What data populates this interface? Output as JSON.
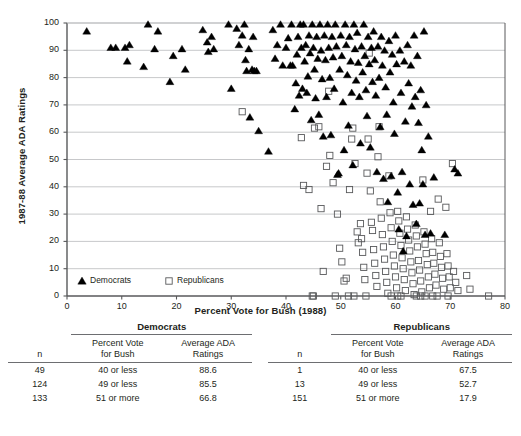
{
  "chart_data": {
    "type": "scatter",
    "title": "",
    "xlabel": "Percent Vote for Bush (1988)",
    "ylabel": "1987-88 Average ADA Ratings",
    "xlim": [
      0,
      80
    ],
    "ylim": [
      0,
      100
    ],
    "xticks": [
      0,
      10,
      20,
      30,
      40,
      50,
      60,
      70,
      80
    ],
    "yticks": [
      0,
      10,
      20,
      30,
      40,
      50,
      60,
      70,
      80,
      90,
      100
    ],
    "grid": "horizontal",
    "legend_position": "inside-bottom-left",
    "series": [
      {
        "name": "Democrats",
        "marker": "filled-triangle",
        "color": "#000000",
        "points": [
          [
            3.6,
            97.0
          ],
          [
            8.0,
            91.0
          ],
          [
            8.9,
            91.0
          ],
          [
            10.6,
            91.0
          ],
          [
            11.0,
            86.0
          ],
          [
            11.4,
            92.0
          ],
          [
            14.0,
            84.0
          ],
          [
            14.8,
            99.5
          ],
          [
            16.0,
            90.5
          ],
          [
            16.6,
            97.0
          ],
          [
            18.8,
            78.5
          ],
          [
            19.4,
            88.0
          ],
          [
            21.0,
            90.5
          ],
          [
            21.6,
            83.0
          ],
          [
            24.8,
            97.5
          ],
          [
            25.6,
            93.0
          ],
          [
            25.8,
            89.5
          ],
          [
            26.4,
            95.0
          ],
          [
            26.8,
            90.5
          ],
          [
            29.5,
            99.5
          ],
          [
            30.0,
            76.0
          ],
          [
            31.0,
            98.0
          ],
          [
            31.4,
            92.0
          ],
          [
            32.0,
            95.5
          ],
          [
            32.4,
            99.5
          ],
          [
            32.6,
            86.5
          ],
          [
            32.8,
            82.5
          ],
          [
            33.2,
            90.5
          ],
          [
            33.4,
            65.5
          ],
          [
            33.8,
            83.0
          ],
          [
            34.0,
            95.0
          ],
          [
            34.2,
            82.5
          ],
          [
            34.6,
            82.5
          ],
          [
            35.0,
            60.5
          ],
          [
            36.8,
            53.0
          ],
          [
            37.6,
            97.5
          ],
          [
            38.0,
            87.0
          ],
          [
            38.4,
            92.0
          ],
          [
            39.0,
            99.5
          ],
          [
            39.4,
            84.5
          ],
          [
            40.0,
            91.0
          ],
          [
            40.4,
            94.5
          ],
          [
            40.8,
            84.5
          ],
          [
            41.0,
            99.5
          ],
          [
            41.2,
            84.5
          ],
          [
            41.6,
            68.5
          ],
          [
            41.8,
            78.0
          ],
          [
            42.0,
            88.5
          ],
          [
            42.2,
            95.0
          ],
          [
            42.4,
            73.5
          ],
          [
            42.6,
            99.5
          ],
          [
            42.8,
            91.0
          ],
          [
            43.0,
            76.0
          ],
          [
            43.2,
            99.5
          ],
          [
            43.4,
            86.0
          ],
          [
            43.6,
            92.0
          ],
          [
            43.8,
            74.5
          ],
          [
            44.0,
            80.5
          ],
          [
            44.2,
            95.5
          ],
          [
            44.4,
            89.0
          ],
          [
            44.6,
            64.5
          ],
          [
            44.8,
            99.5
          ],
          [
            45.0,
            91.0
          ],
          [
            45.2,
            83.0
          ],
          [
            45.4,
            72.5
          ],
          [
            45.6,
            95.0
          ],
          [
            45.8,
            87.0
          ],
          [
            46.0,
            66.5
          ],
          [
            46.2,
            99.5
          ],
          [
            46.4,
            90.0
          ],
          [
            46.6,
            79.5
          ],
          [
            46.8,
            58.5
          ],
          [
            47.0,
            95.5
          ],
          [
            47.2,
            86.5
          ],
          [
            47.4,
            73.0
          ],
          [
            47.6,
            99.5
          ],
          [
            47.8,
            91.0
          ],
          [
            48.0,
            80.0
          ],
          [
            48.2,
            59.0
          ],
          [
            48.4,
            95.0
          ],
          [
            48.6,
            87.5
          ],
          [
            48.8,
            76.0
          ],
          [
            49.0,
            99.5
          ],
          [
            49.2,
            91.5
          ],
          [
            49.4,
            44.5
          ],
          [
            49.6,
            45.0
          ],
          [
            49.8,
            83.0
          ],
          [
            50.0,
            95.5
          ],
          [
            50.2,
            88.0
          ],
          [
            50.4,
            71.0
          ],
          [
            50.6,
            53.5
          ],
          [
            50.8,
            99.5
          ],
          [
            51.0,
            92.0
          ],
          [
            51.2,
            81.0
          ],
          [
            51.4,
            62.5
          ],
          [
            51.6,
            95.0
          ],
          [
            51.8,
            86.0
          ],
          [
            52.0,
            74.5
          ],
          [
            52.2,
            48.0
          ],
          [
            52.4,
            99.5
          ],
          [
            52.6,
            90.5
          ],
          [
            52.8,
            79.0
          ],
          [
            53.0,
            96.5
          ],
          [
            53.2,
            85.5
          ],
          [
            53.4,
            73.0
          ],
          [
            53.6,
            56.0
          ],
          [
            53.8,
            91.5
          ],
          [
            54.0,
            82.0
          ],
          [
            54.2,
            99.5
          ],
          [
            54.4,
            88.0
          ],
          [
            54.6,
            75.5
          ],
          [
            54.8,
            66.0
          ],
          [
            55.0,
            95.0
          ],
          [
            55.2,
            85.0
          ],
          [
            55.4,
            54.5
          ],
          [
            55.6,
            91.0
          ],
          [
            55.8,
            78.5
          ],
          [
            56.0,
            97.0
          ],
          [
            56.2,
            86.5
          ],
          [
            56.4,
            73.5
          ],
          [
            56.6,
            45.5
          ],
          [
            56.8,
            91.5
          ],
          [
            57.0,
            80.0
          ],
          [
            57.2,
            62.0
          ],
          [
            57.4,
            95.0
          ],
          [
            57.6,
            84.5
          ],
          [
            57.8,
            43.0
          ],
          [
            58.0,
            90.0
          ],
          [
            58.2,
            76.5
          ],
          [
            58.4,
            66.5
          ],
          [
            58.6,
            34.5
          ],
          [
            58.8,
            93.5
          ],
          [
            59.0,
            82.0
          ],
          [
            59.2,
            44.0
          ],
          [
            59.4,
            88.5
          ],
          [
            59.6,
            71.0
          ],
          [
            59.8,
            59.5
          ],
          [
            60.0,
            95.5
          ],
          [
            60.2,
            85.0
          ],
          [
            60.4,
            38.0
          ],
          [
            60.6,
            24.5
          ],
          [
            60.8,
            90.0
          ],
          [
            61.0,
            74.5
          ],
          [
            61.2,
            45.5
          ],
          [
            61.4,
            16.5
          ],
          [
            61.6,
            86.0
          ],
          [
            61.8,
            64.0
          ],
          [
            62.0,
            22.0
          ],
          [
            62.2,
            92.0
          ],
          [
            62.4,
            78.0
          ],
          [
            62.6,
            41.0
          ],
          [
            62.8,
            84.5
          ],
          [
            63.0,
            69.5
          ],
          [
            63.2,
            33.5
          ],
          [
            63.4,
            95.5
          ],
          [
            63.6,
            73.0
          ],
          [
            63.8,
            26.5
          ],
          [
            64.0,
            88.0
          ],
          [
            64.2,
            63.5
          ],
          [
            64.4,
            34.0
          ],
          [
            64.6,
            75.5
          ],
          [
            64.8,
            53.5
          ],
          [
            65.0,
            41.0
          ],
          [
            65.2,
            97.0
          ],
          [
            65.4,
            22.5
          ],
          [
            65.6,
            70.0
          ],
          [
            66.0,
            58.5
          ],
          [
            66.4,
            23.0
          ],
          [
            67.0,
            43.5
          ],
          [
            69.0,
            22.5
          ],
          [
            70.8,
            46.5
          ],
          [
            71.4,
            45.0
          ]
        ]
      },
      {
        "name": "Republicans",
        "marker": "open-square",
        "color": "#58595b",
        "points": [
          [
            32.0,
            67.5
          ],
          [
            42.8,
            58.0
          ],
          [
            43.2,
            40.5
          ],
          [
            44.2,
            39.0
          ],
          [
            44.8,
            0.0
          ],
          [
            45.2,
            61.5
          ],
          [
            46.0,
            62.0
          ],
          [
            46.4,
            32.0
          ],
          [
            46.8,
            9.0
          ],
          [
            47.4,
            47.5
          ],
          [
            47.8,
            75.0
          ],
          [
            48.0,
            51.5
          ],
          [
            48.6,
            41.5
          ],
          [
            49.4,
            30.0
          ],
          [
            49.8,
            17.5
          ],
          [
            50.2,
            12.5
          ],
          [
            50.6,
            5.5
          ],
          [
            51.0,
            6.5
          ],
          [
            51.6,
            39.0
          ],
          [
            52.0,
            57.5
          ],
          [
            52.2,
            61.5
          ],
          [
            52.6,
            48.5
          ],
          [
            53.0,
            23.5
          ],
          [
            53.2,
            19.5
          ],
          [
            53.6,
            26.5
          ],
          [
            53.8,
            21.0
          ],
          [
            54.0,
            16.0
          ],
          [
            54.2,
            10.5
          ],
          [
            54.4,
            6.0
          ],
          [
            54.6,
            0.0
          ],
          [
            54.8,
            45.0
          ],
          [
            55.0,
            57.5
          ],
          [
            55.2,
            89.0
          ],
          [
            55.4,
            38.5
          ],
          [
            55.6,
            27.0
          ],
          [
            55.8,
            24.0
          ],
          [
            56.0,
            17.0
          ],
          [
            56.2,
            12.0
          ],
          [
            56.4,
            7.5
          ],
          [
            56.6,
            3.5
          ],
          [
            56.8,
            51.0
          ],
          [
            57.0,
            62.0
          ],
          [
            57.2,
            34.5
          ],
          [
            57.4,
            28.5
          ],
          [
            57.6,
            22.5
          ],
          [
            57.8,
            18.0
          ],
          [
            58.0,
            13.5
          ],
          [
            58.2,
            9.0
          ],
          [
            58.4,
            5.0
          ],
          [
            58.6,
            1.0
          ],
          [
            58.8,
            44.0
          ],
          [
            59.0,
            30.5
          ],
          [
            59.2,
            25.0
          ],
          [
            59.4,
            20.0
          ],
          [
            59.6,
            15.0
          ],
          [
            59.8,
            11.0
          ],
          [
            60.0,
            7.0
          ],
          [
            60.2,
            3.0
          ],
          [
            60.4,
            31.0
          ],
          [
            60.6,
            27.5
          ],
          [
            60.8,
            23.0
          ],
          [
            61.0,
            18.5
          ],
          [
            61.2,
            14.0
          ],
          [
            61.4,
            10.0
          ],
          [
            61.6,
            6.0
          ],
          [
            61.8,
            2.0
          ],
          [
            62.0,
            29.0
          ],
          [
            62.2,
            24.5
          ],
          [
            62.4,
            20.5
          ],
          [
            62.6,
            16.5
          ],
          [
            62.8,
            12.5
          ],
          [
            63.0,
            8.5
          ],
          [
            63.2,
            4.5
          ],
          [
            63.4,
            0.5
          ],
          [
            63.6,
            26.0
          ],
          [
            63.8,
            22.0
          ],
          [
            64.0,
            18.0
          ],
          [
            64.2,
            13.0
          ],
          [
            64.4,
            9.5
          ],
          [
            64.6,
            5.5
          ],
          [
            64.8,
            1.5
          ],
          [
            65.0,
            42.5
          ],
          [
            65.2,
            23.5
          ],
          [
            65.4,
            19.0
          ],
          [
            65.6,
            15.5
          ],
          [
            65.8,
            11.5
          ],
          [
            66.0,
            7.0
          ],
          [
            66.2,
            3.0
          ],
          [
            66.4,
            31.0
          ],
          [
            66.6,
            21.0
          ],
          [
            66.8,
            16.0
          ],
          [
            67.0,
            12.0
          ],
          [
            67.2,
            8.0
          ],
          [
            67.4,
            4.0
          ],
          [
            67.6,
            0.0
          ],
          [
            67.8,
            35.5
          ],
          [
            68.0,
            19.5
          ],
          [
            68.2,
            14.5
          ],
          [
            68.4,
            10.5
          ],
          [
            68.6,
            6.5
          ],
          [
            68.8,
            2.5
          ],
          [
            69.2,
            32.5
          ],
          [
            69.4,
            15.5
          ],
          [
            69.6,
            11.0
          ],
          [
            69.8,
            7.0
          ],
          [
            70.0,
            3.0
          ],
          [
            70.4,
            48.5
          ],
          [
            70.6,
            9.0
          ],
          [
            71.0,
            5.0
          ],
          [
            71.4,
            2.0
          ],
          [
            73.0,
            7.5
          ],
          [
            73.6,
            2.5
          ],
          [
            77.0,
            0.0
          ],
          [
            52.4,
            0.0
          ],
          [
            51.4,
            0.0
          ],
          [
            49.0,
            0.0
          ],
          [
            45.0,
            0.0
          ],
          [
            59.2,
            0.0
          ],
          [
            61.0,
            0.0
          ],
          [
            63.8,
            0.0
          ],
          [
            65.4,
            0.0
          ],
          [
            66.8,
            0.0
          ],
          [
            69.6,
            0.0
          ],
          [
            60.4,
            0.0
          ],
          [
            64.6,
            0.0
          ]
        ]
      }
    ]
  },
  "legend": {
    "democrats_label": "Democrats",
    "republicans_label": "Republicans"
  },
  "tables": [
    {
      "group": "Democrats",
      "columns": [
        "n",
        "Percent Vote\nfor Bush",
        "Average ADA\nRatings"
      ],
      "col_n": "n",
      "col_vote_l1": "Percent Vote",
      "col_vote_l2": "for Bush",
      "col_ada_l1": "Average ADA",
      "col_ada_l2": "Ratings",
      "rows": [
        {
          "n": "49",
          "vote": "40 or less",
          "ada": "88.6"
        },
        {
          "n": "124",
          "vote": "49 or less",
          "ada": "85.5"
        },
        {
          "n": "133",
          "vote": "51 or more",
          "ada": "66.8"
        }
      ]
    },
    {
      "group": "Republicans",
      "columns": [
        "n",
        "Percent Vote\nfor Bush",
        "Average ADA\nRatings"
      ],
      "col_n": "n",
      "col_vote_l1": "Percent Vote",
      "col_vote_l2": "for Bush",
      "col_ada_l1": "Average ADA",
      "col_ada_l2": "Ratings",
      "rows": [
        {
          "n": "1",
          "vote": "40 or less",
          "ada": "67.5"
        },
        {
          "n": "13",
          "vote": "49 or less",
          "ada": "52.7"
        },
        {
          "n": "151",
          "vote": "51 or more",
          "ada": "17.9"
        }
      ]
    }
  ]
}
